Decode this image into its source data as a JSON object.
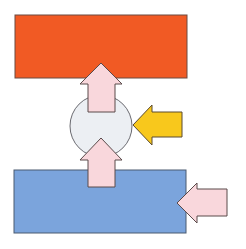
{
  "diagram": {
    "background": "#ffffff",
    "stroke": "#5a4a4a",
    "top_block": {
      "color": "#f15a24",
      "x": 15,
      "y": 15,
      "w": 172,
      "h": 63
    },
    "bottom_block": {
      "color": "#7ba4dc",
      "x": 14,
      "y": 170,
      "w": 172,
      "h": 63
    },
    "center_circle": {
      "color": "#eceff3",
      "cx": 101,
      "cy": 126,
      "r": 31
    },
    "arrows": [
      {
        "id": "arrow-up-top",
        "direction": "up",
        "color": "#f9d7dc"
      },
      {
        "id": "arrow-up-bottom",
        "direction": "up",
        "color": "#f9d7dc"
      },
      {
        "id": "arrow-left-yellow",
        "direction": "left",
        "color": "#f8c81c"
      },
      {
        "id": "arrow-left-pink",
        "direction": "left",
        "color": "#f9d7dc"
      }
    ]
  }
}
